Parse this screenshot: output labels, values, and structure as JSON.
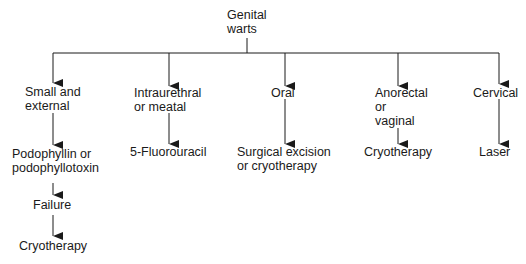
{
  "root": {
    "lines": [
      "Genital",
      "warts"
    ]
  },
  "branches": [
    {
      "condition": [
        "Small and",
        "external"
      ],
      "steps": [
        [
          "Podophyllin or",
          "podophyllotoxin"
        ],
        [
          "Failure"
        ],
        [
          "Cryotherapy"
        ]
      ]
    },
    {
      "condition": [
        "Intraurethral",
        "or meatal"
      ],
      "steps": [
        [
          "5-Fluorouracil"
        ]
      ]
    },
    {
      "condition": [
        "Oral"
      ],
      "steps": [
        [
          "Surgical excision",
          "or cryotherapy"
        ]
      ]
    },
    {
      "condition": [
        "Anorectal",
        "or",
        "vaginal"
      ],
      "steps": [
        [
          "Cryotherapy"
        ]
      ]
    },
    {
      "condition": [
        "Cervical"
      ],
      "steps": [
        [
          "Laser"
        ]
      ]
    }
  ],
  "colors": {
    "line": "#1a1a1a",
    "text": "#1a1a1a",
    "background": "#ffffff"
  }
}
